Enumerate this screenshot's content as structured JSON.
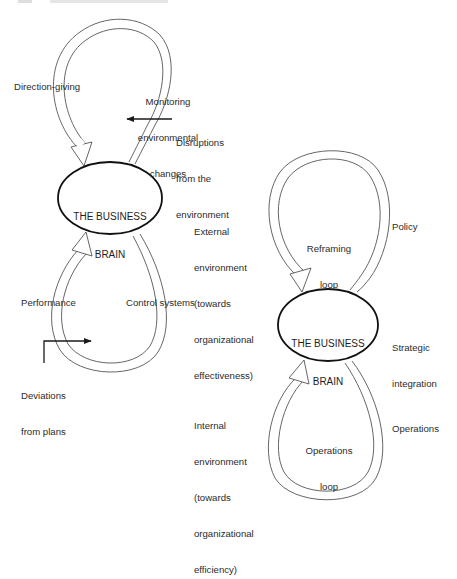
{
  "figure": {
    "left_diagram": {
      "center_label": [
        "THE BUSINESS",
        "BRAIN"
      ],
      "top_loop": {
        "left_label": "Direction-giving",
        "right_label": [
          "Monitoring",
          "environmental",
          "changes"
        ],
        "input_label": [
          "Disruptions",
          "from the",
          "environment"
        ]
      },
      "bottom_loop": {
        "left_label": "Performance",
        "right_label": "Control systems",
        "input_label": [
          "Deviations",
          "from plans"
        ]
      }
    },
    "right_diagram": {
      "center_label": [
        "THE BUSINESS",
        "BRAIN"
      ],
      "side_label": [
        "Strategic",
        "integration"
      ],
      "top_loop": {
        "inner_label": [
          "Reframing",
          "loop"
        ],
        "left_label": [
          "External",
          "environment",
          "(towards",
          "organizational",
          "effectiveness)"
        ],
        "right_label": "Policy"
      },
      "bottom_loop": {
        "inner_label": [
          "Operations",
          "loop"
        ],
        "left_label": [
          "Internal",
          "environment",
          "(towards",
          "organizational",
          "efficiency)"
        ],
        "right_label": "Operations"
      }
    },
    "colors": {
      "ink": "#1a1a1a",
      "loop_stroke": "#555555",
      "label": "#2b2b2b"
    }
  }
}
